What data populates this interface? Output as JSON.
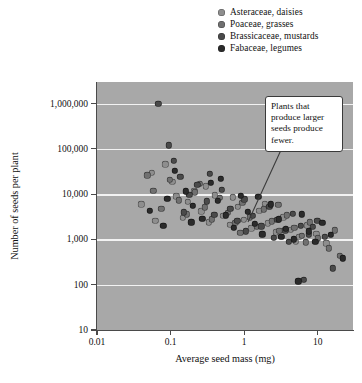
{
  "figure": {
    "legend": {
      "position": "top-right",
      "items": [
        {
          "label": "Asteraceae, daisies",
          "color": "#8e8e8e"
        },
        {
          "label": "Poaceae, grasses",
          "color": "#707070"
        },
        {
          "label": "Brassicaceae, mustards",
          "color": "#4a4a4a"
        },
        {
          "label": "Fabaceae, legumes",
          "color": "#2b2b2b"
        }
      ]
    },
    "annotation": {
      "text": "Plants that produce larger seeds produce fewer."
    },
    "colors": {
      "plot_background": "#a8a8a8",
      "gridline": "#f2f2f2",
      "axis": "#4a4a4a",
      "text": "#111111"
    }
  },
  "chart_data": {
    "type": "scatter",
    "title": "",
    "xlabel": "Average seed mass (mg)",
    "ylabel": "Number of seeds per plant",
    "xscale": "log",
    "yscale": "log",
    "xlim": [
      0.01,
      30
    ],
    "ylim": [
      10,
      3000000
    ],
    "xticks": [
      0.01,
      0.1,
      1,
      10
    ],
    "xticklabels": [
      "0.01",
      "0.1",
      "1",
      "10"
    ],
    "yticks": [
      10,
      100,
      1000,
      10000,
      100000,
      1000000
    ],
    "yticklabels": [
      "10",
      "100",
      "1,000",
      "10,000",
      "100,000",
      "1,000,000"
    ],
    "grid": "horizontal",
    "legend_position": "top-right",
    "series": [
      {
        "name": "Asteraceae, daisies",
        "color": "#8e8e8e",
        "points": [
          [
            0.04,
            6000
          ],
          [
            0.055,
            30000
          ],
          [
            0.062,
            2600
          ],
          [
            0.105,
            19000
          ],
          [
            0.12,
            9000
          ],
          [
            0.145,
            3000
          ],
          [
            0.21,
            12000
          ],
          [
            0.26,
            4200
          ],
          [
            0.33,
            2400
          ],
          [
            0.4,
            9500
          ],
          [
            0.52,
            3300
          ],
          [
            0.64,
            2100
          ],
          [
            0.82,
            5200
          ],
          [
            0.98,
            2700
          ],
          [
            1.25,
            1750
          ],
          [
            1.6,
            4300
          ],
          [
            2.1,
            2250
          ],
          [
            2.7,
            1450
          ],
          [
            3.4,
            3100
          ],
          [
            4.3,
            1650
          ],
          [
            5.6,
            1150
          ],
          [
            7.2,
            2050
          ],
          [
            9.5,
            1350
          ],
          [
            13.0,
            820
          ],
          [
            0.085,
            46000
          ],
          [
            0.17,
            6800
          ],
          [
            0.3,
            15000
          ],
          [
            0.7,
            8600
          ],
          [
            1.9,
            6200
          ],
          [
            5.0,
            900
          ]
        ]
      },
      {
        "name": "Poaceae, grasses",
        "color": "#707070",
        "points": [
          [
            0.058,
            12000
          ],
          [
            0.075,
            4800
          ],
          [
            0.098,
            21000
          ],
          [
            0.13,
            7300
          ],
          [
            0.165,
            3600
          ],
          [
            0.215,
            11000
          ],
          [
            0.29,
            5100
          ],
          [
            0.36,
            2800
          ],
          [
            0.47,
            8200
          ],
          [
            0.6,
            3900
          ],
          [
            0.76,
            2300
          ],
          [
            0.94,
            6400
          ],
          [
            1.18,
            3100
          ],
          [
            1.48,
            1900
          ],
          [
            1.85,
            4600
          ],
          [
            2.35,
            2500
          ],
          [
            3.0,
            1550
          ],
          [
            3.8,
            3400
          ],
          [
            4.8,
            1800
          ],
          [
            6.1,
            1200
          ],
          [
            7.8,
            2400
          ],
          [
            10.0,
            1050
          ],
          [
            14.0,
            640
          ],
          [
            20.0,
            430
          ],
          [
            0.048,
            26000
          ],
          [
            0.25,
            17000
          ],
          [
            0.88,
            1400
          ],
          [
            2.9,
            5800
          ],
          [
            6.8,
            860
          ],
          [
            17.0,
            1600
          ]
        ]
      },
      {
        "name": "Brassicaceae, mustards",
        "color": "#4a4a4a",
        "points": [
          [
            0.068,
            1000000
          ],
          [
            0.095,
            120000
          ],
          [
            0.11,
            55000
          ],
          [
            0.135,
            24000
          ],
          [
            0.18,
            9800
          ],
          [
            0.23,
            16000
          ],
          [
            0.31,
            6900
          ],
          [
            0.39,
            3500
          ],
          [
            0.5,
            12500
          ],
          [
            0.65,
            4700
          ],
          [
            0.8,
            2600
          ],
          [
            1.0,
            7700
          ],
          [
            1.3,
            3300
          ],
          [
            1.7,
            1950
          ],
          [
            2.2,
            5300
          ],
          [
            2.8,
            2700
          ],
          [
            3.6,
            1600
          ],
          [
            4.6,
            3700
          ],
          [
            5.9,
            2000
          ],
          [
            7.5,
            1300
          ],
          [
            9.8,
            2600
          ],
          [
            12.5,
            1150
          ],
          [
            0.15,
            4000
          ],
          [
            0.34,
            28000
          ],
          [
            1.05,
            1500
          ],
          [
            2.5,
            1100
          ],
          [
            4.0,
            900
          ],
          [
            6.5,
            130
          ],
          [
            8.5,
            1900
          ],
          [
            16.0,
            230
          ]
        ]
      },
      {
        "name": "Fabaceae, legumes",
        "color": "#2b2b2b",
        "points": [
          [
            0.052,
            4300
          ],
          [
            0.08,
            2000
          ],
          [
            0.115,
            33000
          ],
          [
            0.16,
            11500
          ],
          [
            0.2,
            5600
          ],
          [
            0.27,
            2900
          ],
          [
            0.35,
            18000
          ],
          [
            0.44,
            7100
          ],
          [
            0.56,
            3400
          ],
          [
            0.72,
            1800
          ],
          [
            0.9,
            9200
          ],
          [
            1.12,
            4100
          ],
          [
            1.4,
            2200
          ],
          [
            1.75,
            1300
          ],
          [
            2.3,
            6000
          ],
          [
            2.95,
            2800
          ],
          [
            3.7,
            1700
          ],
          [
            4.7,
            1000
          ],
          [
            6.0,
            3600
          ],
          [
            7.6,
            1500
          ],
          [
            9.2,
            900
          ],
          [
            11.5,
            2300
          ],
          [
            15.0,
            1250
          ],
          [
            22.0,
            380
          ],
          [
            0.09,
            7800
          ],
          [
            0.19,
            2400
          ],
          [
            0.48,
            22000
          ],
          [
            1.55,
            8800
          ],
          [
            3.2,
            1150
          ],
          [
            5.4,
            120
          ]
        ]
      }
    ]
  }
}
